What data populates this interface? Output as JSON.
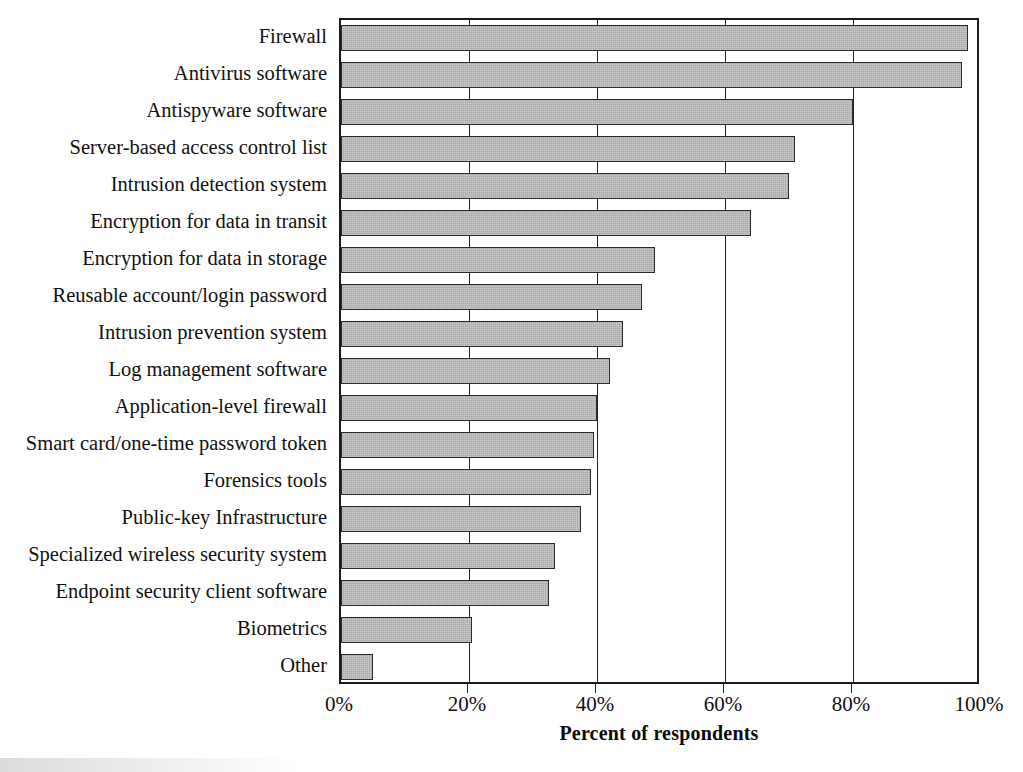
{
  "chart_data": {
    "type": "bar",
    "orientation": "horizontal",
    "title": "",
    "xlabel": "Percent of respondents",
    "ylabel": "",
    "xlim": [
      0,
      100
    ],
    "xticks": [
      0,
      20,
      40,
      60,
      80,
      100
    ],
    "xticklabels": [
      "0%",
      "20%",
      "40%",
      "60%",
      "80%",
      "100%"
    ],
    "grid": "vertical",
    "legend": "none",
    "categories": [
      "Firewall",
      "Antivirus software",
      "Antispyware software",
      "Server-based access control list",
      "Intrusion detection system",
      "Encryption for data in transit",
      "Encryption for data in storage",
      "Reusable account/login password",
      "Intrusion prevention system",
      "Log management software",
      "Application-level firewall",
      "Smart card/one-time password token",
      "Forensics tools",
      "Public-key Infrastructure",
      "Specialized wireless security system",
      "Endpoint security client software",
      "Biometrics",
      "Other"
    ],
    "values": [
      98,
      97,
      80,
      71,
      70,
      64,
      49,
      47,
      44,
      42,
      40,
      39.5,
      39,
      37.5,
      33.5,
      32.5,
      20.5,
      5
    ]
  },
  "axis": {
    "x_title": "Percent of respondents"
  },
  "style": {
    "bar_fill": "#a8a8a8",
    "bar_border": "#2b2b2b",
    "axis_color": "#1a1a1a",
    "background": "#ffffff",
    "text_color": "#111111"
  }
}
